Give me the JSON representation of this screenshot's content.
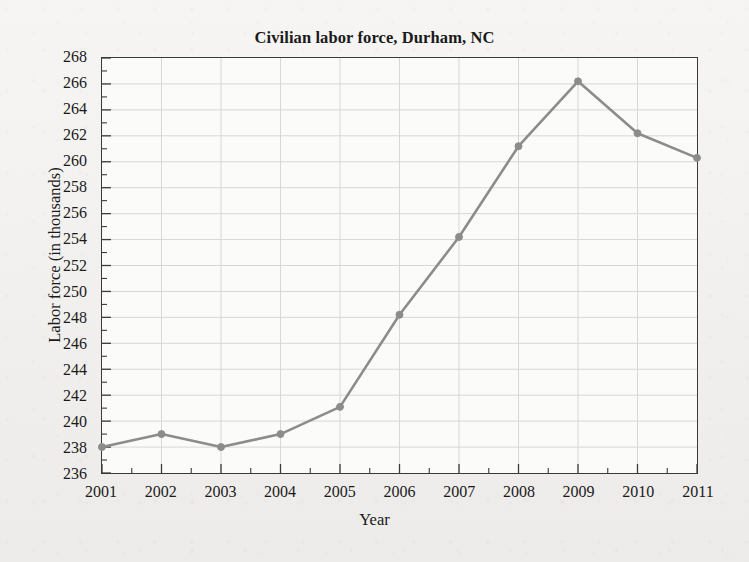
{
  "figure": {
    "background_color": "#f1f0ee",
    "plot_background_color": "#fbfbfa",
    "axis_color": "#3a3a3a",
    "grid_color": "#d7d7d7"
  },
  "chart_data": {
    "type": "line",
    "title": "Civilian labor force, Durham, NC",
    "xlabel": "Year",
    "ylabel": "Labor force (in thousands)",
    "x": [
      2001,
      2002,
      2003,
      2004,
      2005,
      2006,
      2007,
      2008,
      2009,
      2010,
      2011
    ],
    "categories": [
      "2001",
      "2002",
      "2003",
      "2004",
      "2005",
      "2006",
      "2007",
      "2008",
      "2009",
      "2010",
      "2011"
    ],
    "values": [
      238.0,
      239.0,
      238.0,
      239.0,
      241.1,
      248.2,
      254.2,
      261.2,
      266.2,
      262.2,
      260.3
    ],
    "series": [
      {
        "name": "Civilian labor force",
        "values": [
          238.0,
          239.0,
          238.0,
          239.0,
          241.1,
          248.2,
          254.2,
          261.2,
          266.2,
          262.2,
          260.3
        ],
        "color": "#8c8c8c",
        "marker": "circle"
      }
    ],
    "xlim": [
      2001,
      2011
    ],
    "ylim": [
      236,
      268
    ],
    "ytick_step": 2,
    "yticks": [
      236,
      238,
      240,
      242,
      244,
      246,
      248,
      250,
      252,
      254,
      256,
      258,
      260,
      262,
      264,
      266,
      268
    ],
    "ytick_labels": [
      "236",
      "238",
      "240",
      "242",
      "244",
      "246",
      "248",
      "250",
      "252",
      "254",
      "256",
      "258",
      "260",
      "262",
      "264",
      "266",
      "268"
    ],
    "xticks": [
      2001,
      2002,
      2003,
      2004,
      2005,
      2006,
      2007,
      2008,
      2009,
      2010,
      2011
    ],
    "xtick_labels": [
      "2001",
      "2002",
      "2003",
      "2004",
      "2005",
      "2006",
      "2007",
      "2008",
      "2009",
      "2010",
      "2011"
    ],
    "x_minor_ticks": true,
    "grid": "horizontal-and-vertical",
    "legend": "none",
    "line_color": "#8c8c8c",
    "marker_color": "#8c8c8c",
    "line_width": 2.6,
    "marker_size": 7
  }
}
